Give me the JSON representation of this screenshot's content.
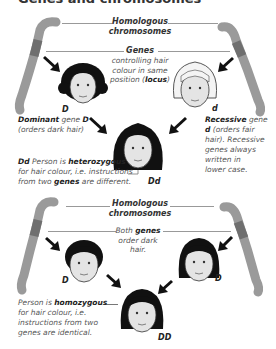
{
  "title": "Genes and chromosomes",
  "top_section": {
    "header_line1": "Homologous",
    "header_line2": "chromosomes",
    "genes_label": "Genes",
    "genes_desc_1": "controlling hair",
    "genes_desc_2": "colour in same",
    "genes_desc_3_pre": "position (",
    "genes_desc_3_bold": "locus",
    "genes_desc_3_post": ")",
    "left_face_label": "D",
    "right_face_label": "d",
    "child_face_label": "Dd",
    "dominant_bold": "Dominant",
    "dominant_text1": " gene ",
    "dominant_gene": "D",
    "dominant_text2": "(orders dark hair)",
    "recessive_bold": "Recessive",
    "recessive_text1": " gene",
    "recessive_gene": "d",
    "recessive_text2": " (orders fair",
    "recessive_text3": "hair). Recessive",
    "recessive_text4": "genes always",
    "recessive_text5": "written in",
    "recessive_text6": "lower case.",
    "hetero_bold1": "Dd",
    "hetero_text1": " Person is ",
    "hetero_bold2": "heterozygous",
    "hetero_text2": "for hair colour, i.e. instructions",
    "hetero_text3": "from two ",
    "hetero_bold3": "genes",
    "hetero_text4": " are different."
  },
  "bottom_section": {
    "header_line1": "Homologous",
    "header_line2": "chromosomes",
    "both_pre": "Both ",
    "both_bold": "genes",
    "both_line2": "order dark",
    "both_line3": "hair.",
    "left_face_label": "D",
    "right_face_label": "D",
    "child_face_label": "DD",
    "homo_text1": "Person is ",
    "homo_bold": "homozygous",
    "homo_text2": "for hair colour, i.e.",
    "homo_text3": "instructions from two",
    "homo_text4": "genes are identical."
  },
  "colors": {
    "chromosome": "#9a9a9a",
    "chromosome_band": "#6f6f6f",
    "skin": "#e4e4e4",
    "hair_dark": "#111111",
    "hair_fair": "#f2f2f2",
    "arrow": "#111111",
    "line": "#999999"
  }
}
